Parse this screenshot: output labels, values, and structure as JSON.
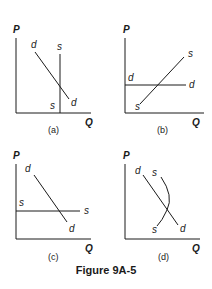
{
  "figure": {
    "title": "Figure 9A-5",
    "axis_labels": {
      "y": "P",
      "x": "Q"
    },
    "panels": [
      {
        "id": "a",
        "caption": "(a)",
        "demand_label": "d",
        "supply_label": "s",
        "description": "Downward-sloping demand d; vertical (perfectly inelastic) supply s"
      },
      {
        "id": "b",
        "caption": "(b)",
        "demand_label": "d",
        "supply_label": "s",
        "description": "Horizontal (perfectly elastic) demand d; upward-sloping supply s"
      },
      {
        "id": "c",
        "caption": "(c)",
        "demand_label": "d",
        "supply_label": "s",
        "description": "Downward-sloping demand d; horizontal (perfectly elastic) supply s"
      },
      {
        "id": "d",
        "caption": "(d)",
        "demand_label": "d",
        "supply_label": "s",
        "description": "Downward-sloping demand d; backward-bending curved supply s"
      }
    ]
  }
}
